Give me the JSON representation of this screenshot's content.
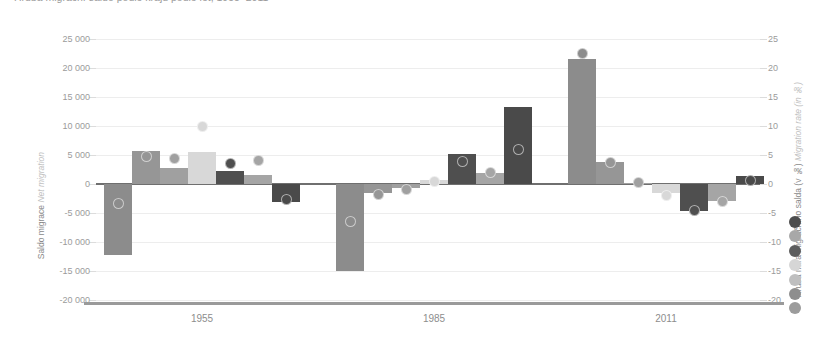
{
  "title": "Hrubá migrační saldo podle krajů podle let, 1955–2011",
  "axes": {
    "left": {
      "cz": "Saldo migrace",
      "en": "Net migration",
      "ticks": [
        "25 000",
        "20 000",
        "15 000",
        "10 000",
        "5 000",
        "0",
        "-5 000",
        "-10 000",
        "-15 000",
        "-20 000"
      ],
      "min": -20000,
      "max": 25000
    },
    "right": {
      "cz": "Hrubá míra migračního salda (v ‰)",
      "en": "Migration rate (in ‰)",
      "ticks": [
        "25",
        "20",
        "15",
        "10",
        "5",
        "0",
        "-5",
        "-10",
        "-15",
        "-20"
      ],
      "min": -20,
      "max": 25
    }
  },
  "legend": {
    "colors": [
      "#4d4d4d",
      "#a8a8a8",
      "#5d5d5d",
      "#d6d6d6",
      "#bfbfbf",
      "#8e8e8e",
      "#9c9c9c"
    ]
  },
  "chart_data": {
    "type": "bar",
    "title": "Hrubá migrační saldo podle krajů podle let, 1955–2011",
    "xlabel": "",
    "ylabel": "Saldo migrace / Net migration",
    "ylim": [
      -20000,
      25000
    ],
    "y2label": "Hrubá míra migračního salda (v ‰) / Migration rate (in ‰)",
    "y2lim": [
      -20,
      25
    ],
    "grid": true,
    "legend_position": "right",
    "categories": [
      "1955",
      "1985",
      "2011"
    ],
    "series_note": "7 regional series per year; bars = net migration (left axis), dots = migration rate per mille (right axis)",
    "colors": [
      "#8c8c8c",
      "#969696",
      "#a0a0a0",
      "#d8d8d8",
      "#4f4f4f",
      "#a5a5a5",
      "#4a4a4a"
    ],
    "groups": [
      {
        "label": "1955",
        "bars": [
          -12300,
          5700,
          2700,
          5600,
          2300,
          1600,
          -3100
        ],
        "dots": [
          -3.3,
          4.8,
          4.4,
          10.0,
          3.6,
          4.0,
          -2.6
        ]
      },
      {
        "label": "1985",
        "bars": [
          -15000,
          -1500,
          -700,
          700,
          5200,
          1900,
          13300
        ],
        "dots": [
          -6.4,
          -1.8,
          -0.9,
          0.5,
          3.9,
          1.9,
          5.9
        ]
      },
      {
        "label": "2011",
        "bars": [
          21500,
          3800,
          200,
          -1500,
          -4600,
          -2900,
          1400
        ],
        "dots": [
          22.5,
          3.7,
          0.2,
          -2.0,
          -4.6,
          -3.0,
          0.6
        ]
      }
    ]
  }
}
